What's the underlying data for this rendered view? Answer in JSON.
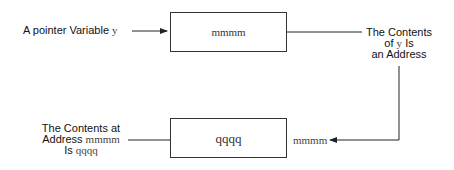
{
  "diagram": {
    "pointer_label": {
      "text": "A pointer Variable",
      "var": "y"
    },
    "pointer_box": {
      "value": "mmmm"
    },
    "contents_label": {
      "line1": "The Contents",
      "line2_pre": "of",
      "line2_var": "y",
      "line2_post": "Is",
      "line3": "an Address"
    },
    "target_label": {
      "line1": "The Contents at",
      "line2_pre": "Address",
      "line2_var": "mmmm",
      "line3_pre": "Is",
      "line3_var": "qqqq"
    },
    "target_box": {
      "value": "qqqq"
    },
    "target_address": "mmmm"
  }
}
